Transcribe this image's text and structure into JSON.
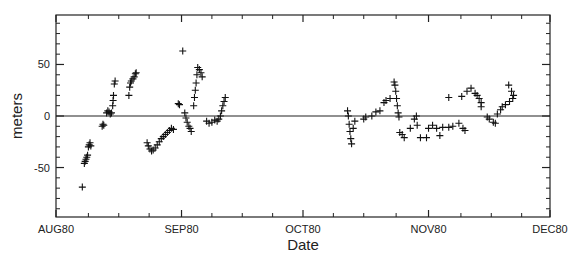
{
  "chart_data": {
    "type": "scatter",
    "title": "",
    "xlabel": "Date",
    "ylabel": "meters",
    "x_unit": "days since AUG80 (Aug 1, 1980)",
    "xlim": [
      0,
      122
    ],
    "ylim": [
      -98,
      98
    ],
    "x_ticks": [
      {
        "value": 0,
        "label": "AUG80"
      },
      {
        "value": 31,
        "label": "SEP80"
      },
      {
        "value": 61,
        "label": "OCT80"
      },
      {
        "value": 92,
        "label": "NOV80"
      },
      {
        "value": 122,
        "label": "DEC80"
      }
    ],
    "x_minor_ticks": [
      8,
      15.5,
      23,
      38.5,
      46,
      53.5,
      68.5,
      76,
      84,
      100,
      107.5,
      115
    ],
    "y_ticks": [
      {
        "value": 50,
        "label": "50"
      },
      {
        "value": 0,
        "label": "0"
      },
      {
        "value": -50,
        "label": "-50"
      }
    ],
    "y_minor_ticks": [
      -90,
      -80,
      -70,
      -60,
      -40,
      -30,
      -20,
      -10,
      10,
      20,
      30,
      40,
      60,
      70,
      80,
      90
    ],
    "reference_line": {
      "y": 0
    },
    "marker": "plus",
    "grid": false,
    "legend": "none",
    "series": [
      {
        "name": "position residual",
        "points": [
          [
            6.5,
            -69
          ],
          [
            7.0,
            -46
          ],
          [
            7.2,
            -44
          ],
          [
            7.4,
            -42
          ],
          [
            7.6,
            -40
          ],
          [
            7.8,
            -38
          ],
          [
            8.0,
            -30
          ],
          [
            8.2,
            -28
          ],
          [
            8.4,
            -26
          ],
          [
            8.6,
            -29
          ],
          [
            11.4,
            -10
          ],
          [
            11.6,
            -8
          ],
          [
            11.8,
            -9
          ],
          [
            12.5,
            3
          ],
          [
            12.8,
            5
          ],
          [
            13.1,
            4
          ],
          [
            13.4,
            2
          ],
          [
            13.7,
            3
          ],
          [
            14.0,
            10
          ],
          [
            14.1,
            15
          ],
          [
            14.2,
            20
          ],
          [
            14.4,
            31
          ],
          [
            14.6,
            34
          ],
          [
            18.0,
            20
          ],
          [
            18.2,
            28
          ],
          [
            18.4,
            32
          ],
          [
            18.6,
            34
          ],
          [
            19.0,
            36
          ],
          [
            19.3,
            38
          ],
          [
            19.6,
            41
          ],
          [
            19.8,
            42
          ],
          [
            22.5,
            -26
          ],
          [
            22.8,
            -29
          ],
          [
            23.2,
            -32
          ],
          [
            23.6,
            -34
          ],
          [
            24.0,
            -33
          ],
          [
            24.5,
            -31
          ],
          [
            25.0,
            -28
          ],
          [
            25.5,
            -25
          ],
          [
            26.0,
            -22
          ],
          [
            26.5,
            -20
          ],
          [
            27.0,
            -18
          ],
          [
            27.5,
            -16
          ],
          [
            28.0,
            -14
          ],
          [
            28.5,
            -12
          ],
          [
            29.0,
            -13
          ],
          [
            30.2,
            12
          ],
          [
            30.5,
            11
          ],
          [
            31.3,
            63
          ],
          [
            31.8,
            3
          ],
          [
            32.1,
            -2
          ],
          [
            32.4,
            -6
          ],
          [
            32.8,
            -10
          ],
          [
            33.1,
            -12
          ],
          [
            33.4,
            -15
          ],
          [
            34.0,
            10
          ],
          [
            34.2,
            18
          ],
          [
            34.4,
            25
          ],
          [
            34.6,
            32
          ],
          [
            34.8,
            40
          ],
          [
            35.0,
            47
          ],
          [
            35.4,
            45
          ],
          [
            35.8,
            42
          ],
          [
            36.1,
            38
          ],
          [
            37.2,
            -5
          ],
          [
            37.8,
            -7
          ],
          [
            38.5,
            -6
          ],
          [
            39.2,
            -4
          ],
          [
            39.8,
            -5
          ],
          [
            40.2,
            -3
          ],
          [
            40.6,
            0
          ],
          [
            40.9,
            5
          ],
          [
            41.2,
            10
          ],
          [
            41.5,
            14
          ],
          [
            41.8,
            18
          ],
          [
            72.0,
            5
          ],
          [
            72.2,
            0
          ],
          [
            72.4,
            -8
          ],
          [
            72.6,
            -15
          ],
          [
            72.8,
            -22
          ],
          [
            73.0,
            -27
          ],
          [
            73.4,
            -12
          ],
          [
            73.8,
            -5
          ],
          [
            76.0,
            -3
          ],
          [
            76.5,
            -1
          ],
          [
            78.0,
            0
          ],
          [
            79.0,
            4
          ],
          [
            80.0,
            5
          ],
          [
            81.0,
            13
          ],
          [
            81.5,
            15
          ],
          [
            82.5,
            17
          ],
          [
            83.5,
            33
          ],
          [
            83.7,
            30
          ],
          [
            83.9,
            24
          ],
          [
            84.1,
            17
          ],
          [
            84.3,
            10
          ],
          [
            84.5,
            3
          ],
          [
            84.7,
            -1
          ],
          [
            84.9,
            -16
          ],
          [
            85.5,
            -18
          ],
          [
            86.0,
            -21
          ],
          [
            87.5,
            -12
          ],
          [
            88.5,
            -3
          ],
          [
            89.0,
            0
          ],
          [
            89.2,
            -9
          ],
          [
            90.0,
            -21
          ],
          [
            91.5,
            -21
          ],
          [
            92.0,
            -12
          ],
          [
            93.0,
            -9
          ],
          [
            94.0,
            -12
          ],
          [
            94.8,
            -19
          ],
          [
            95.5,
            -11
          ],
          [
            97.0,
            -11
          ],
          [
            98.0,
            -10
          ],
          [
            99.5,
            -7
          ],
          [
            97.0,
            18
          ],
          [
            100.5,
            -12
          ],
          [
            101.0,
            -14
          ],
          [
            100.2,
            19
          ],
          [
            101.5,
            24
          ],
          [
            102.5,
            27
          ],
          [
            103.5,
            22
          ],
          [
            104.0,
            20
          ],
          [
            104.5,
            17
          ],
          [
            105.0,
            13
          ],
          [
            105.0,
            9
          ],
          [
            106.5,
            -1
          ],
          [
            107.0,
            -3
          ],
          [
            108.0,
            -6
          ],
          [
            108.5,
            -7
          ],
          [
            109.0,
            2
          ],
          [
            109.8,
            6
          ],
          [
            110.2,
            9
          ],
          [
            111.0,
            11
          ],
          [
            112.0,
            14
          ],
          [
            112.8,
            17
          ],
          [
            111.8,
            30
          ],
          [
            112.5,
            24
          ],
          [
            113.0,
            20
          ]
        ]
      }
    ]
  }
}
